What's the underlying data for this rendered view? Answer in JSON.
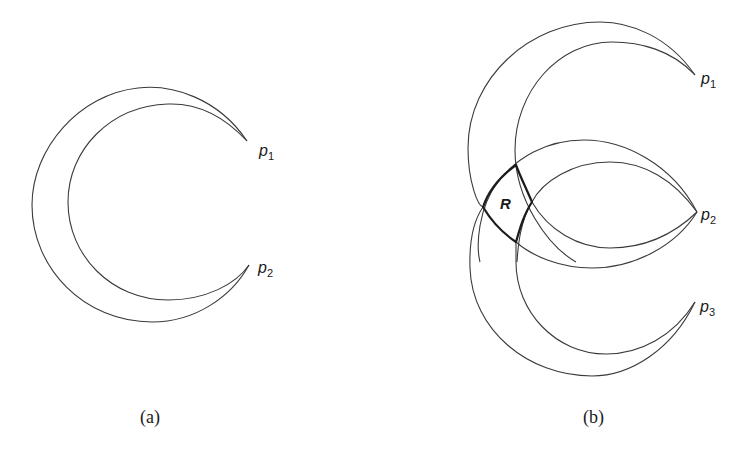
{
  "figure": {
    "panel_a": {
      "caption": "(a)",
      "points": [
        {
          "name": "p",
          "sub": "1"
        },
        {
          "name": "p",
          "sub": "2"
        }
      ]
    },
    "panel_b": {
      "caption": "(b)",
      "region_label": "R",
      "points": [
        {
          "name": "p",
          "sub": "1"
        },
        {
          "name": "p",
          "sub": "2"
        },
        {
          "name": "p",
          "sub": "3"
        }
      ]
    },
    "colors": {
      "stroke": "#3a3a3a",
      "region_stroke": "#1c1c1c",
      "background": "#ffffff"
    }
  }
}
